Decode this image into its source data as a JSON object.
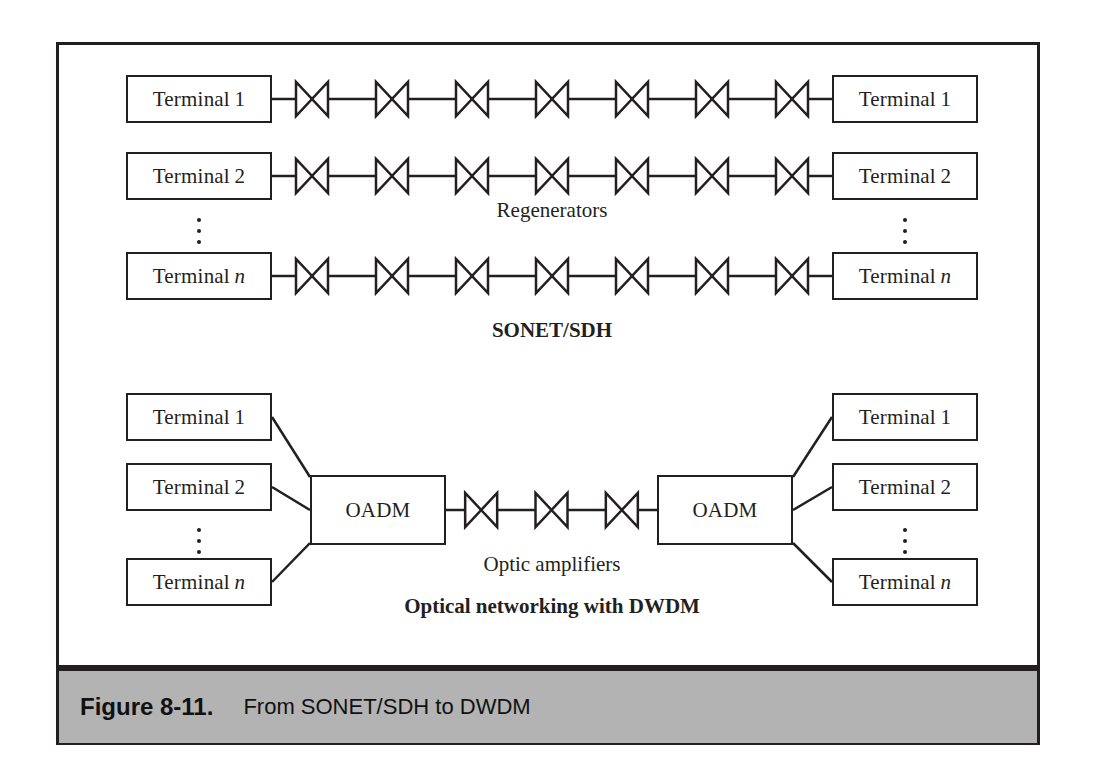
{
  "figure": {
    "caption_number": "Figure 8-11.",
    "caption_text": "From SONET/SDH to DWDM",
    "band_color": "#b3b3b3",
    "frame_color": "#231f20",
    "line_color": "#231f20"
  },
  "sonet_section": {
    "section_label": "SONET/SDH",
    "chain_label": "Regenerators",
    "regenerator_count_per_row": 7,
    "ellipsis_glyph": "⋮",
    "left_terminals": [
      {
        "name": "Terminal",
        "index": "1",
        "index_italic": false
      },
      {
        "name": "Terminal",
        "index": "2",
        "index_italic": false
      },
      {
        "name": "Terminal",
        "index": "n",
        "index_italic": true
      }
    ],
    "right_terminals": [
      {
        "name": "Terminal",
        "index": "1",
        "index_italic": false
      },
      {
        "name": "Terminal",
        "index": "2",
        "index_italic": false
      },
      {
        "name": "Terminal",
        "index": "n",
        "index_italic": true
      }
    ]
  },
  "dwdm_section": {
    "section_label": "Optical networking with DWDM",
    "chain_label": "Optic amplifiers",
    "amplifier_count": 3,
    "ellipsis_glyph": "⋮",
    "left_oadm_label": "OADM",
    "right_oadm_label": "OADM",
    "left_terminals": [
      {
        "name": "Terminal",
        "index": "1",
        "index_italic": false
      },
      {
        "name": "Terminal",
        "index": "2",
        "index_italic": false
      },
      {
        "name": "Terminal",
        "index": "n",
        "index_italic": true
      }
    ],
    "right_terminals": [
      {
        "name": "Terminal",
        "index": "1",
        "index_italic": false
      },
      {
        "name": "Terminal",
        "index": "2",
        "index_italic": false
      },
      {
        "name": "Terminal",
        "index": "n",
        "index_italic": true
      }
    ]
  }
}
